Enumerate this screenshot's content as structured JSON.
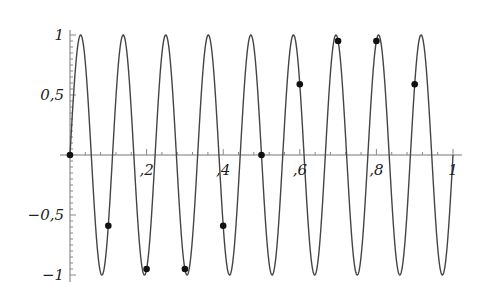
{
  "chart_data": {
    "type": "line",
    "title": "",
    "xlabel": "",
    "ylabel": "",
    "xlim": [
      0,
      1
    ],
    "ylim": [
      -1,
      1
    ],
    "grid": false,
    "legend": null,
    "x_ticks": [
      "0.2",
      "0.4",
      "0.6",
      "0.8",
      "1"
    ],
    "y_ticks": [
      "1",
      "0.5",
      "-0.5",
      "-1"
    ],
    "x_tick_display": [
      ",2",
      ",4",
      ",6",
      ",8",
      "1"
    ],
    "y_tick_display": [
      "1",
      "0,5",
      "−0,5",
      "−1"
    ],
    "series": [
      {
        "name": "curve",
        "type": "line",
        "function": "sin(18*pi*x)",
        "cycles": 9,
        "color": "#444444"
      },
      {
        "name": "samples",
        "type": "scatter",
        "color": "#111111",
        "x": [
          0,
          0.1,
          0.2,
          0.3,
          0.4,
          0.5,
          0.6,
          0.7,
          0.8,
          0.9
        ],
        "y": [
          0,
          -0.59,
          -0.95,
          -0.95,
          -0.59,
          0,
          0.59,
          0.95,
          0.95,
          0.59
        ]
      }
    ]
  }
}
